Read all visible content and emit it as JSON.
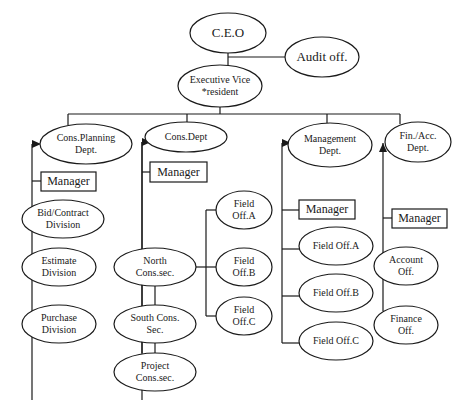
{
  "diagram": {
    "colors": {
      "stroke": "#1a1a1a",
      "fill": "#ffffff",
      "text": "#1a1a1a"
    },
    "nodes": [
      {
        "id": "ceo",
        "shape": "ellipse",
        "label": "C.E.O",
        "cx": 228,
        "cy": 33,
        "rx": 38,
        "ry": 20,
        "fs": 13
      },
      {
        "id": "audit",
        "shape": "ellipse",
        "label": "Audit off.",
        "cx": 322,
        "cy": 57,
        "rx": 37,
        "ry": 20,
        "fs": 13
      },
      {
        "id": "evp",
        "shape": "ellipse",
        "label": "Executive Vice\n*resident",
        "cx": 220,
        "cy": 86,
        "rx": 42,
        "ry": 21,
        "fs": 10
      },
      {
        "id": "cons_planning",
        "shape": "ellipse",
        "label": "Cons.Planning\nDept.",
        "cx": 86,
        "cy": 144,
        "rx": 46,
        "ry": 20,
        "fs": 10
      },
      {
        "id": "cons_dept",
        "shape": "ellipse",
        "label": "Cons.Dept",
        "cx": 186,
        "cy": 137,
        "rx": 41,
        "ry": 15,
        "fs": 10
      },
      {
        "id": "management",
        "shape": "ellipse",
        "label": "Management\nDept.",
        "cx": 330,
        "cy": 145,
        "rx": 42,
        "ry": 22,
        "fs": 10
      },
      {
        "id": "finacc",
        "shape": "ellipse",
        "label": "Fin./Acc.\nDept.",
        "cx": 418,
        "cy": 142,
        "rx": 33,
        "ry": 20,
        "fs": 10
      },
      {
        "id": "mgr1",
        "shape": "rect",
        "label": "Manager",
        "x": 41,
        "y": 172,
        "w": 55,
        "h": 19,
        "fs": 12
      },
      {
        "id": "mgr2",
        "shape": "rect",
        "label": "Manager",
        "x": 150,
        "y": 162,
        "w": 57,
        "h": 20,
        "fs": 12
      },
      {
        "id": "mgr3",
        "shape": "rect",
        "label": "Manager",
        "x": 299,
        "y": 200,
        "w": 56,
        "h": 19,
        "fs": 12
      },
      {
        "id": "mgr4",
        "shape": "rect",
        "label": "Manager",
        "x": 392,
        "y": 209,
        "w": 55,
        "h": 19,
        "fs": 12
      },
      {
        "id": "bid",
        "shape": "ellipse",
        "label": "Bid/Contract\nDivision",
        "cx": 63,
        "cy": 219,
        "rx": 41,
        "ry": 19,
        "fs": 10
      },
      {
        "id": "estimate",
        "shape": "ellipse",
        "label": "Estimate\nDivision",
        "cx": 59,
        "cy": 267,
        "rx": 37,
        "ry": 19,
        "fs": 10
      },
      {
        "id": "purchase",
        "shape": "ellipse",
        "label": "Purchase\nDivision",
        "cx": 59,
        "cy": 324,
        "rx": 37,
        "ry": 19,
        "fs": 10
      },
      {
        "id": "north",
        "shape": "ellipse",
        "label": "North\nCons.sec.",
        "cx": 155,
        "cy": 267,
        "rx": 41,
        "ry": 19,
        "fs": 10
      },
      {
        "id": "south",
        "shape": "ellipse",
        "label": "South Cons.\nSec.",
        "cx": 155,
        "cy": 324,
        "rx": 41,
        "ry": 19,
        "fs": 10
      },
      {
        "id": "project",
        "shape": "ellipse",
        "label": "Project\nCons.sec.",
        "cx": 155,
        "cy": 372,
        "rx": 41,
        "ry": 19,
        "fs": 10
      },
      {
        "id": "foa_left",
        "shape": "ellipse",
        "label": "Field\nOff.A",
        "cx": 244,
        "cy": 210,
        "rx": 28,
        "ry": 19,
        "fs": 10
      },
      {
        "id": "fob_left",
        "shape": "ellipse",
        "label": "Field\nOff.B",
        "cx": 244,
        "cy": 267,
        "rx": 28,
        "ry": 19,
        "fs": 10
      },
      {
        "id": "foc_left",
        "shape": "ellipse",
        "label": "Field\nOff.C",
        "cx": 244,
        "cy": 316,
        "rx": 28,
        "ry": 19,
        "fs": 10
      },
      {
        "id": "foa_right",
        "shape": "ellipse",
        "label": "Field Off.A",
        "cx": 336,
        "cy": 246,
        "rx": 37,
        "ry": 19,
        "fs": 10
      },
      {
        "id": "fob_right",
        "shape": "ellipse",
        "label": "Field Off.B",
        "cx": 336,
        "cy": 293,
        "rx": 37,
        "ry": 19,
        "fs": 10
      },
      {
        "id": "foc_right",
        "shape": "ellipse",
        "label": "Field Off.C",
        "cx": 336,
        "cy": 341,
        "rx": 37,
        "ry": 19,
        "fs": 10
      },
      {
        "id": "account",
        "shape": "ellipse",
        "label": "Account\nOff.",
        "cx": 406,
        "cy": 266,
        "rx": 32,
        "ry": 19,
        "fs": 10
      },
      {
        "id": "finance",
        "shape": "ellipse",
        "label": "Finance\nOff.",
        "cx": 406,
        "cy": 325,
        "rx": 32,
        "ry": 19,
        "fs": 10
      }
    ],
    "lines": [
      [
        228,
        53,
        228,
        66
      ],
      [
        228,
        57,
        285,
        57
      ],
      [
        220,
        107,
        220,
        114
      ],
      [
        68,
        114,
        400,
        114
      ],
      [
        68,
        114,
        68,
        125
      ],
      [
        187,
        114,
        187,
        122
      ],
      [
        327,
        114,
        327,
        123
      ],
      [
        400,
        114,
        400,
        124
      ],
      [
        32,
        144,
        32,
        400
      ],
      [
        32,
        181,
        41,
        181
      ],
      [
        142,
        142,
        142,
        400
      ],
      [
        142,
        172,
        150,
        172
      ],
      [
        142,
        142,
        142,
        353
      ],
      [
        155,
        286,
        155,
        305
      ],
      [
        155,
        343,
        155,
        353
      ],
      [
        196,
        267,
        206,
        267
      ],
      [
        206,
        210,
        206,
        316
      ],
      [
        206,
        210,
        216,
        210
      ],
      [
        206,
        267,
        216,
        267
      ],
      [
        206,
        316,
        216,
        316
      ],
      [
        282,
        143,
        282,
        343
      ],
      [
        282,
        210,
        299,
        210
      ],
      [
        282,
        249,
        299,
        249
      ],
      [
        282,
        296,
        299,
        296
      ],
      [
        282,
        343,
        299,
        343
      ],
      [
        383,
        143,
        383,
        311
      ],
      [
        383,
        218,
        392,
        218
      ]
    ],
    "arrows": [
      {
        "x": 32,
        "y": 144,
        "dir": "right"
      },
      {
        "x": 142,
        "y": 142,
        "dir": "right"
      },
      {
        "x": 282,
        "y": 143,
        "dir": "right"
      },
      {
        "x": 383,
        "y": 143,
        "dir": "up"
      }
    ]
  }
}
